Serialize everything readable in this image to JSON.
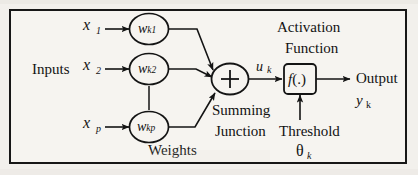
{
  "figure": {
    "background_color": "#f2f0ec",
    "frame_color": "#171717",
    "ink_color": "#121212"
  },
  "labels": {
    "inputs": "Inputs",
    "weights": "Weights",
    "summing_junction_line1": "Summing",
    "summing_junction_line2": "Junction",
    "activation_line1": "Activation",
    "activation_line2": "Function",
    "threshold": "Threshold",
    "output": "Output"
  },
  "inputs": [
    {
      "name": "x-1",
      "base": "x",
      "sub": "1"
    },
    {
      "name": "x-2",
      "base": "x",
      "sub": "2"
    },
    {
      "name": "x-p",
      "base": "x",
      "sub": "p"
    }
  ],
  "weights": [
    {
      "name": "w-k1",
      "base": "w",
      "sub": "k1"
    },
    {
      "name": "w-k2",
      "base": "w",
      "sub": "k2"
    },
    {
      "name": "w-kp",
      "base": "w",
      "sub": "kp"
    }
  ],
  "summing_junction": {
    "symbol": "+",
    "output_signal_base": "u",
    "output_signal_sub": "k"
  },
  "activation_function": {
    "symbol_italic": "f",
    "symbol_rest": "(.)"
  },
  "threshold": {
    "symbol": "θ",
    "sub": "k"
  },
  "output": {
    "base": "y",
    "sub": "k"
  }
}
